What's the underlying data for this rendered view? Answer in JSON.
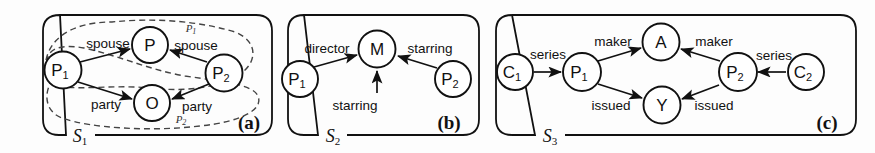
{
  "figure": {
    "caption_labels": [
      "(a)",
      "(b)",
      "(c)"
    ],
    "background": "#fdfdfd",
    "ink": "#111111"
  },
  "panels": [
    {
      "id": "panel-a",
      "caption": "(a)",
      "scope": "S",
      "scope_sub": "1",
      "nodes": [
        {
          "id": "a-p1",
          "label": "P",
          "sub": "1"
        },
        {
          "id": "a-p",
          "label": "P",
          "sub": ""
        },
        {
          "id": "a-o",
          "label": "O",
          "sub": ""
        },
        {
          "id": "a-p2",
          "label": "P",
          "sub": "2"
        }
      ],
      "edges": [
        {
          "from": "P1",
          "to": "P",
          "label": "spouse"
        },
        {
          "from": "P2",
          "to": "P",
          "label": "spouse"
        },
        {
          "from": "P1",
          "to": "O",
          "label": "party"
        },
        {
          "from": "P2",
          "to": "O",
          "label": "party"
        }
      ],
      "regions": [
        {
          "id": "region-p1",
          "label": "P",
          "sub": "1"
        },
        {
          "id": "region-p2",
          "label": "P",
          "sub": "2"
        }
      ]
    },
    {
      "id": "panel-b",
      "caption": "(b)",
      "scope": "S",
      "scope_sub": "2",
      "nodes": [
        {
          "id": "b-p1",
          "label": "P",
          "sub": "1"
        },
        {
          "id": "b-m",
          "label": "M",
          "sub": ""
        },
        {
          "id": "b-p2",
          "label": "P",
          "sub": "2"
        }
      ],
      "edges": [
        {
          "from": "P1",
          "to": "M",
          "label": "director"
        },
        {
          "from": "P1",
          "to": "M",
          "label": "starring"
        },
        {
          "from": "P2",
          "to": "M",
          "label": "starring"
        }
      ]
    },
    {
      "id": "panel-c",
      "caption": "(c)",
      "scope": "S",
      "scope_sub": "3",
      "nodes": [
        {
          "id": "c-c1",
          "label": "C",
          "sub": "1"
        },
        {
          "id": "c-p1",
          "label": "P",
          "sub": "1"
        },
        {
          "id": "c-a",
          "label": "A",
          "sub": ""
        },
        {
          "id": "c-y",
          "label": "Y",
          "sub": ""
        },
        {
          "id": "c-p2",
          "label": "P",
          "sub": "2"
        },
        {
          "id": "c-c2",
          "label": "C",
          "sub": "2"
        }
      ],
      "edges": [
        {
          "from": "C1",
          "to": "P1",
          "label": "series"
        },
        {
          "from": "P1",
          "to": "A",
          "label": "maker"
        },
        {
          "from": "P1",
          "to": "Y",
          "label": "issued"
        },
        {
          "from": "P2",
          "to": "A",
          "label": "maker"
        },
        {
          "from": "P2",
          "to": "Y",
          "label": "issued"
        },
        {
          "from": "C2",
          "to": "P2",
          "label": "series"
        }
      ]
    }
  ]
}
